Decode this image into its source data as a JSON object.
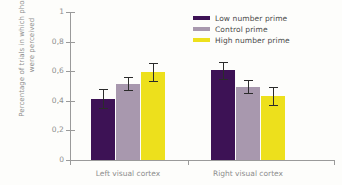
{
  "chart_data": {
    "type": "bar",
    "title": "",
    "xlabel": "",
    "ylabel": "Percentage of trials in which phosphines were perceived",
    "categories": [
      "Left visual cortex",
      "Right visual cortex"
    ],
    "ylim": [
      0,
      1
    ],
    "ytick_labels": [
      "0",
      "0,2",
      "0,4",
      "0,6",
      "0,8",
      "1"
    ],
    "ytick_values": [
      0,
      0.2,
      0.4,
      0.6,
      0.8,
      1
    ],
    "grid": false,
    "legend_position": "top-right",
    "series": [
      {
        "name": "Low number prime",
        "color": "#3d1255",
        "values": [
          0.415,
          0.605
        ],
        "errors": [
          0.065,
          0.055
        ]
      },
      {
        "name": "Control prime",
        "color": "#a898ae",
        "values": [
          0.515,
          0.495
        ],
        "errors": [
          0.045,
          0.045
        ]
      },
      {
        "name": "High number prime",
        "color": "#ede01c",
        "values": [
          0.595,
          0.43
        ],
        "errors": [
          0.06,
          0.06
        ]
      }
    ]
  },
  "axis": {
    "color": "#9a9a9a",
    "text_color": "#8e8e8e"
  }
}
